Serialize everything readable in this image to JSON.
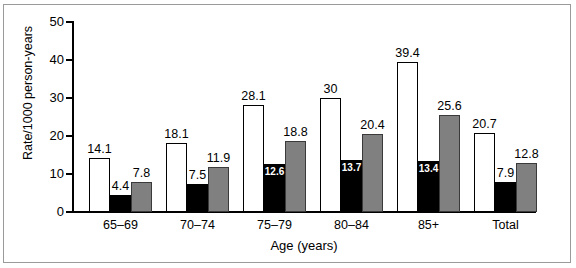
{
  "chart_data": {
    "type": "bar",
    "title": "",
    "xlabel": "Age (years)",
    "ylabel": "Rate/1000 person-years",
    "ylim": [
      0,
      50
    ],
    "yticks": [
      "0",
      "10",
      "20",
      "30",
      "40",
      "50"
    ],
    "grid": false,
    "legend": "none",
    "categories": [
      "65–69",
      "70–74",
      "75–79",
      "80–84",
      "85+",
      "Total"
    ],
    "series": [
      {
        "name": "white",
        "style": "white-bar",
        "values": [
          14.1,
          18.1,
          28.1,
          30,
          39.4,
          20.7
        ],
        "labels": [
          "14.1",
          "18.1",
          "28.1",
          "30",
          "39.4",
          "20.7"
        ],
        "label_position": [
          "above",
          "above",
          "above",
          "above",
          "above",
          "above"
        ]
      },
      {
        "name": "black",
        "style": "black-bar",
        "values": [
          4.4,
          7.5,
          12.6,
          13.7,
          13.4,
          7.9
        ],
        "labels": [
          "4.4",
          "7.5",
          "12.6",
          "13.7",
          "13.4",
          "7.9"
        ],
        "label_position": [
          "above",
          "above",
          "inside",
          "inside",
          "inside",
          "above"
        ]
      },
      {
        "name": "gray",
        "style": "gray-bar",
        "values": [
          7.8,
          11.9,
          18.8,
          20.4,
          25.6,
          12.8
        ],
        "labels": [
          "7.8",
          "11.9",
          "18.8",
          "20.4",
          "25.6",
          "12.8"
        ],
        "label_position": [
          "above",
          "above",
          "above",
          "above",
          "above",
          "above"
        ]
      }
    ],
    "colors": {
      "white_bar": "#ffffff",
      "black_bar": "#000000",
      "gray_bar": "#808080",
      "axis": "#000000",
      "frame": "#9a9a9a",
      "background": "#ffffff"
    }
  }
}
